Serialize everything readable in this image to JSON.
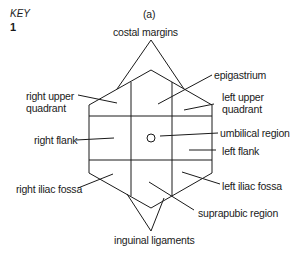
{
  "key": {
    "label": "KEY",
    "number": "1"
  },
  "panel_label": "(a)",
  "labels": {
    "costal_margins": "costal margins",
    "epigastrium": "epigastrium",
    "right_upper_quadrant": [
      "right upper",
      "quadrant"
    ],
    "left_upper_quadrant": [
      "left upper",
      "quadrant"
    ],
    "right_flank": "right flank",
    "umbilical_region": "umbilical region",
    "left_flank": "left flank",
    "right_iliac_fossa": "right iliac fossa",
    "left_iliac_fossa": "left iliac fossa",
    "suprapubic_region": "suprapubic region",
    "inguinal_ligaments": "inguinal ligaments"
  }
}
